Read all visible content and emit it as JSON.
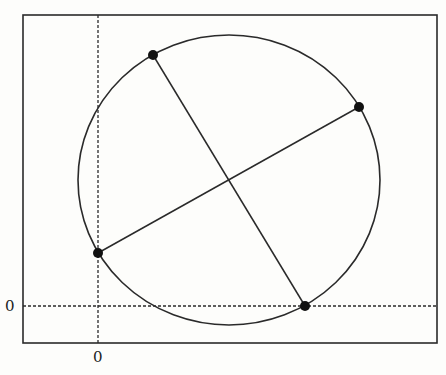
{
  "diagram": {
    "frame": {
      "x": 23,
      "y": 15,
      "width": 414,
      "height": 328
    },
    "axes": {
      "x_zero_label": "0",
      "y_zero_label": "0",
      "x_zero_px": 98,
      "y_zero_px": 306
    },
    "circle": {
      "cx": 229,
      "cy": 180,
      "rx": 151,
      "ry": 145
    },
    "points": [
      {
        "name": "top-point",
        "x": 153,
        "y": 55
      },
      {
        "name": "right-point",
        "x": 359,
        "y": 107
      },
      {
        "name": "left-point",
        "x": 98,
        "y": 253
      },
      {
        "name": "bottom-point",
        "x": 305,
        "y": 306
      }
    ],
    "chords": [
      {
        "name": "chord-top-bottom",
        "from": "top-point",
        "to": "bottom-point"
      },
      {
        "name": "chord-left-right",
        "from": "left-point",
        "to": "right-point"
      }
    ],
    "colors": {
      "stroke": "#2a2a2a",
      "background": "#fdfdfb"
    }
  }
}
